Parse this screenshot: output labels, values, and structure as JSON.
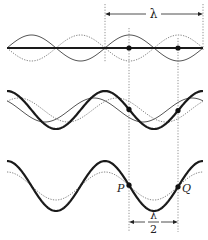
{
  "diagram": {
    "labels": {
      "wavelength": "λ",
      "half_wavelength_num": "λ",
      "half_wavelength_den": "2",
      "point_p": "P",
      "point_q": "Q"
    },
    "geometry": {
      "x_start": 7,
      "x_end": 203,
      "wavelength_px": 98,
      "guide_lines_x": [
        105,
        129,
        178,
        203
      ]
    },
    "rows": [
      {
        "name": "row-1-standing-wave-node",
        "center_y": 48,
        "waves": [
          {
            "name": "wave-solid-thin",
            "style": "thin",
            "amplitude": 13,
            "phase_px": 0,
            "sign": -1
          },
          {
            "name": "wave-dotted",
            "style": "dotted",
            "amplitude": 13,
            "phase_px": 0,
            "sign": 1
          },
          {
            "name": "resultant-flat",
            "style": "heavy",
            "amplitude": 0,
            "phase_px": 0,
            "sign": 1
          }
        ],
        "points_x": [
          129,
          178
        ]
      },
      {
        "name": "row-2-partial-superposition",
        "center_y": 110,
        "waves": [
          {
            "name": "resultant-heavy",
            "style": "heavy",
            "amplitude": 19,
            "phase_px": 7,
            "type": "cos"
          },
          {
            "name": "wave-solid-thin",
            "style": "thin",
            "amplitude": 12,
            "phase_px": 94,
            "type": "cos"
          },
          {
            "name": "wave-dotted",
            "style": "dotted",
            "amplitude": 12,
            "phase_px": 117,
            "type": "cos"
          }
        ],
        "points_x": [
          129,
          178
        ]
      },
      {
        "name": "row-3-amplitude-difference",
        "center_y": 186,
        "waves": [
          {
            "name": "resultant-heavy",
            "style": "heavy",
            "amplitude": 25,
            "phase_px": 7,
            "type": "cos"
          },
          {
            "name": "wave-dotted",
            "style": "dotted",
            "amplitude": 14,
            "phase_px": 7,
            "type": "cos"
          }
        ],
        "points_x": [
          129,
          178
        ]
      }
    ],
    "colors": {
      "heavy": "#1a1a1a",
      "thin": "#555555",
      "dotted": "#888888",
      "guide": "#666666"
    }
  }
}
